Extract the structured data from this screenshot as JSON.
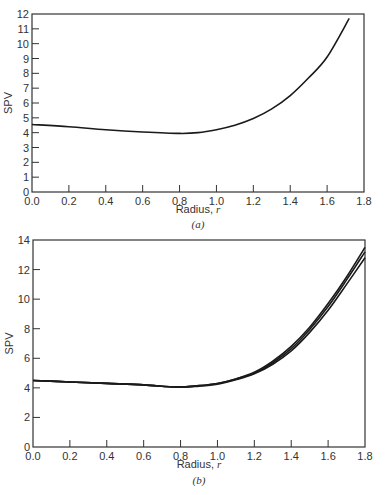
{
  "chart_data": [
    {
      "type": "line",
      "panel_label": "(a)",
      "title": "",
      "xlabel": "Radius, r",
      "ylabel": "SPV",
      "xlim": [
        0.0,
        1.8
      ],
      "ylim": [
        0,
        12
      ],
      "xticks": [
        "0.0",
        "0.2",
        "0.4",
        "0.6",
        "0.8",
        "1.0",
        "1.2",
        "1.4",
        "1.6",
        "1.8"
      ],
      "yticks": [
        "0",
        "1",
        "2",
        "3",
        "4",
        "5",
        "6",
        "7",
        "8",
        "9",
        "10",
        "11",
        "12"
      ],
      "grid": false,
      "legend": null,
      "series": [
        {
          "name": "SPV",
          "x": [
            0.0,
            0.2,
            0.4,
            0.6,
            0.8,
            0.9,
            1.0,
            1.1,
            1.2,
            1.3,
            1.4,
            1.5,
            1.6,
            1.72
          ],
          "y": [
            4.55,
            4.4,
            4.2,
            4.05,
            3.95,
            4.0,
            4.2,
            4.5,
            4.95,
            5.6,
            6.5,
            7.7,
            9.1,
            11.7
          ]
        }
      ]
    },
    {
      "type": "line",
      "panel_label": "(b)",
      "title": "",
      "xlabel": "Radius, r",
      "ylabel": "SPV",
      "xlim": [
        0.0,
        1.8
      ],
      "ylim": [
        0,
        14
      ],
      "xticks": [
        "0.0",
        "0.2",
        "0.4",
        "0.6",
        "0.8",
        "1.0",
        "1.2",
        "1.4",
        "1.6",
        "1.8"
      ],
      "yticks": [
        "0",
        "2",
        "4",
        "6",
        "8",
        "10",
        "12",
        "14"
      ],
      "grid": false,
      "legend": null,
      "series": [
        {
          "name": "curve-1",
          "x": [
            0.0,
            0.2,
            0.4,
            0.6,
            0.78,
            0.9,
            1.0,
            1.1,
            1.2,
            1.3,
            1.4,
            1.5,
            1.6,
            1.7,
            1.8
          ],
          "y": [
            4.5,
            4.4,
            4.3,
            4.2,
            4.05,
            4.15,
            4.3,
            4.6,
            5.05,
            5.8,
            6.8,
            8.1,
            9.7,
            11.5,
            13.5
          ]
        },
        {
          "name": "curve-2",
          "x": [
            0.0,
            0.2,
            0.4,
            0.6,
            0.78,
            0.9,
            1.0,
            1.1,
            1.2,
            1.3,
            1.4,
            1.5,
            1.6,
            1.7,
            1.8
          ],
          "y": [
            4.5,
            4.4,
            4.3,
            4.2,
            4.05,
            4.15,
            4.3,
            4.6,
            5.0,
            5.7,
            6.65,
            7.95,
            9.5,
            11.3,
            13.2
          ]
        },
        {
          "name": "curve-3",
          "x": [
            0.0,
            0.2,
            0.4,
            0.6,
            0.78,
            0.9,
            1.0,
            1.1,
            1.2,
            1.3,
            1.4,
            1.5,
            1.6,
            1.7,
            1.8
          ],
          "y": [
            4.5,
            4.4,
            4.3,
            4.2,
            4.05,
            4.12,
            4.25,
            4.55,
            4.95,
            5.6,
            6.5,
            7.75,
            9.25,
            11.0,
            12.8
          ]
        }
      ]
    }
  ],
  "panels": {
    "a": {
      "label": "(a)",
      "xlabel": "Radius, ",
      "xlabel_var": "r",
      "ylabel": "SPV"
    },
    "b": {
      "label": "(b)",
      "xlabel": "Radius, ",
      "xlabel_var": "r",
      "ylabel": "SPV"
    }
  },
  "style": {
    "line_color": "#1a1a1a",
    "axis_color": "#333333",
    "background": "#ffffff"
  }
}
